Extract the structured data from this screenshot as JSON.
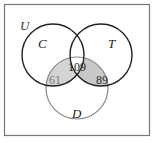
{
  "diagram": {
    "type": "venn",
    "universe_label": "U",
    "sets": [
      {
        "label": "C",
        "cx": 53,
        "cy": 55,
        "r": 31
      },
      {
        "label": "T",
        "cx": 101,
        "cy": 55,
        "r": 31
      },
      {
        "label": "D",
        "cx": 77,
        "cy": 88,
        "r": 31
      }
    ],
    "regions": [
      {
        "name": "C∩T∩D",
        "value": "109"
      },
      {
        "name": "C∩D only",
        "value": "61"
      },
      {
        "name": "T∩D only",
        "value": "89"
      }
    ],
    "colors": {
      "shade": "#d4d4d4",
      "stroke_dark": "#222222",
      "stroke_light": "#888888",
      "frame": "#777777"
    }
  }
}
